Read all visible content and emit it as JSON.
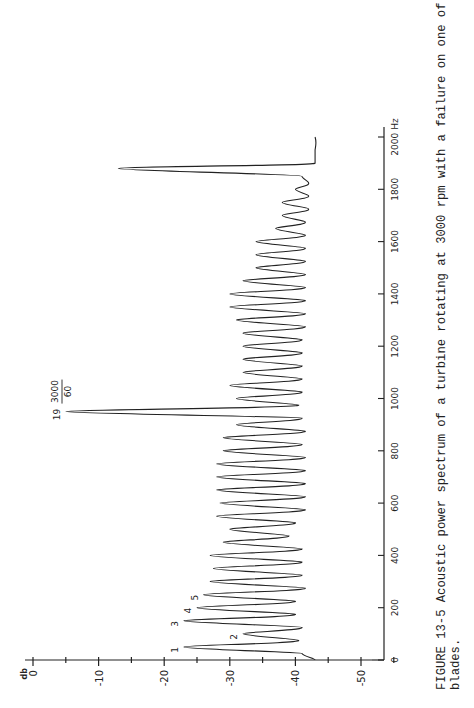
{
  "figure": {
    "caption_line1": "FIGURE 13-5  Acoustic power spectrum of a turbine rotating at 3000 rpm with a failure on one of the 19",
    "caption_line2": "blades."
  },
  "chart_data": {
    "type": "line",
    "title": "Acoustic power spectrum of a turbine rotating at 3000 rpm with a failure on one of the 19 blades",
    "orientation": "rotated-90-ccw",
    "xlabel": "Hz",
    "ylabel": "db",
    "xlim": [
      0,
      2000
    ],
    "ylim": [
      -55,
      0
    ],
    "x_ticks": [
      0,
      200,
      400,
      600,
      800,
      1000,
      1200,
      1400,
      1600,
      1800,
      2000
    ],
    "x_tick_labels": [
      "0",
      "200",
      "400",
      "600",
      "800",
      "1000",
      "1200",
      "1400",
      "1600",
      "1800",
      "2000 Hz"
    ],
    "y_ticks": [
      0,
      -10,
      -20,
      -30,
      -40,
      -50
    ],
    "y_tick_labels": [
      "0",
      "-10",
      "-20",
      "-30",
      "-40",
      "-50"
    ],
    "grid": false,
    "series": [
      {
        "name": "Acoustic power spectrum (peaks)",
        "x": [
          50,
          100,
          150,
          200,
          250,
          300,
          350,
          400,
          450,
          500,
          550,
          600,
          650,
          700,
          750,
          800,
          850,
          900,
          950,
          1000,
          1050,
          1100,
          1150,
          1200,
          1250,
          1300,
          1350,
          1400,
          1450,
          1500,
          1550,
          1600,
          1650,
          1700,
          1750,
          1800,
          1850,
          1880,
          1950
        ],
        "values": [
          -23,
          -32,
          -23,
          -25,
          -26,
          -27,
          -27.5,
          -27,
          -29,
          -30,
          -28,
          -28.5,
          -28,
          -28,
          -28,
          -29,
          -29,
          -31,
          -5,
          -31,
          -30,
          -32,
          -32,
          -32,
          -32,
          -31,
          -30,
          -30,
          -32,
          -34,
          -34,
          -34,
          -37,
          -38,
          -38,
          -40,
          -41,
          -13,
          -43
        ]
      },
      {
        "name": "Inter-peak troughs (approx.)",
        "x": [
          0,
          25,
          75,
          125,
          175,
          225,
          275,
          325,
          375,
          425,
          475,
          525,
          575,
          625,
          675,
          725,
          775,
          825,
          875,
          925,
          975,
          1025,
          1075,
          1125,
          1175,
          1225,
          1275,
          1325,
          1375,
          1425,
          1475,
          1525,
          1575,
          1625,
          1675,
          1725,
          1775,
          1825,
          1900,
          2000
        ],
        "values": [
          -43,
          -41,
          -40.5,
          -41,
          -40,
          -40,
          -41.5,
          -41,
          -41,
          -41,
          -39,
          -40,
          -41.5,
          -41.5,
          -41.5,
          -41.5,
          -41.5,
          -41,
          -41.5,
          -41,
          -40.5,
          -41,
          -41,
          -41,
          -41,
          -41,
          -41.5,
          -41.5,
          -41.5,
          -41.5,
          -41.5,
          -41.5,
          -41.5,
          -41.5,
          -41.5,
          -42,
          -42,
          -42,
          -43,
          -43
        ]
      }
    ],
    "annotations": [
      {
        "text": "1",
        "x": 50,
        "y": -23
      },
      {
        "text": "2",
        "x": 100,
        "y": -32
      },
      {
        "text": "3",
        "x": 150,
        "y": -23
      },
      {
        "text": "4",
        "x": 200,
        "y": -25
      },
      {
        "text": "5",
        "x": 250,
        "y": -26
      },
      {
        "text": "19",
        "x": 950,
        "y": -5
      },
      {
        "text": "3000/60",
        "x": 950,
        "y": -3,
        "note": "fraction label above peak 19"
      }
    ]
  },
  "labels": {
    "db_unit": "db",
    "hz_unit": "Hz",
    "frac_num": "3000",
    "frac_den": "60",
    "harmonic_19": "19"
  }
}
